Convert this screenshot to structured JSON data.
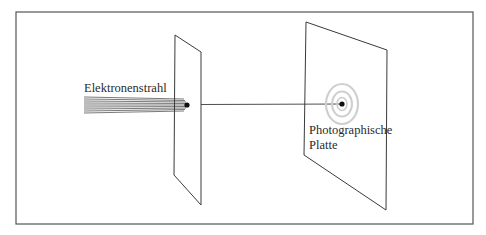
{
  "diagram": {
    "labels": {
      "beam": "Elektronenstrahl",
      "plate_line1": "Photographische",
      "plate_line2": "Platte"
    },
    "colors": {
      "ink": "#3a3a3a",
      "frame": "#555555",
      "beam": "#6b6b6b",
      "rings": "#cfcfcf",
      "background": "#ffffff"
    }
  }
}
